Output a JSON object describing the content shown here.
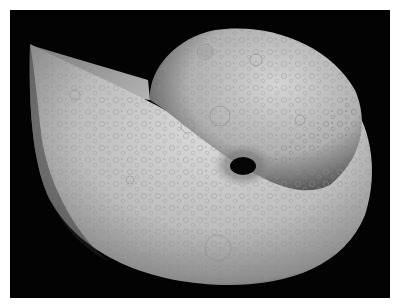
{
  "image": {
    "description": "Cratered nautilus-like shell rendered in grey on a black background",
    "subject": "moon-textured spiral shell",
    "colors": {
      "background": "#030303",
      "border": "#ffffff",
      "shell_light": "#d8d8d8",
      "shell_mid": "#a9a9a9",
      "shell_dark": "#5a5a5a",
      "hole": "#050505"
    }
  }
}
